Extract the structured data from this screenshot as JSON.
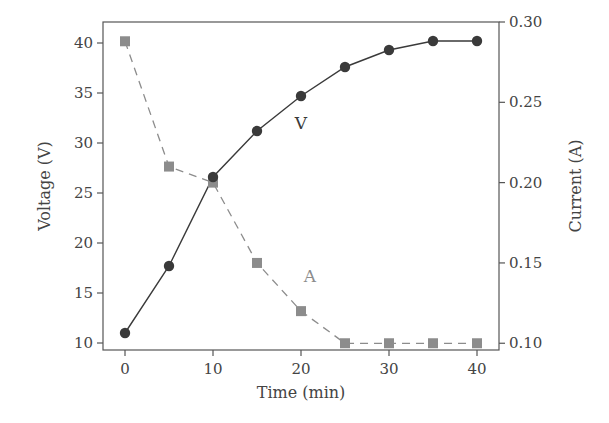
{
  "chart_data": {
    "type": "line",
    "title": "",
    "xlabel": "Time (min)",
    "ylabel": "Voltage (V)",
    "ylabel_right": "Current (A)",
    "x": [
      0,
      5,
      10,
      15,
      20,
      25,
      30,
      35,
      40
    ],
    "xlim": [
      -2.5,
      42.5
    ],
    "ylim": [
      9.3,
      42.1
    ],
    "ylim_right": [
      0.0958,
      0.3
    ],
    "x_ticks": [
      "0",
      "10",
      "20",
      "30",
      "40"
    ],
    "y_ticks": [
      "10",
      "15",
      "20",
      "25",
      "30",
      "35",
      "40"
    ],
    "y_ticks_right": [
      "0.10",
      "0.15",
      "0.20",
      "0.25",
      "0.30"
    ],
    "grid": false,
    "legend": "inline labels",
    "series": [
      {
        "name": "V",
        "axis": "left",
        "values": [
          11.0,
          17.7,
          26.6,
          31.2,
          34.7,
          37.6,
          39.3,
          40.2,
          40.2
        ],
        "line_style": "solid",
        "marker": "circle",
        "color": "#3a3a3a",
        "label_position": {
          "x": 20.0,
          "y": 32.0
        }
      },
      {
        "name": "A",
        "axis": "right",
        "values": [
          0.288,
          0.21,
          0.2,
          0.15,
          0.12,
          0.1,
          0.1,
          0.1,
          0.1
        ],
        "line_style": "dashed",
        "marker": "square",
        "color": "#8c8c8c",
        "label_position": {
          "x": 21.0,
          "y": 0.142
        }
      }
    ]
  }
}
